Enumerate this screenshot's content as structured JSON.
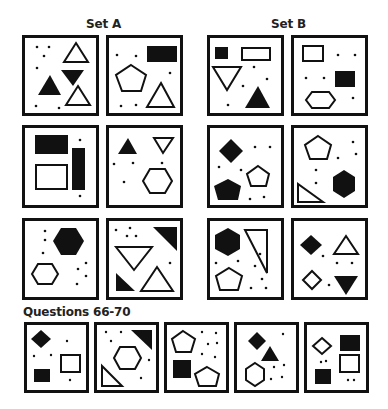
{
  "labels": {
    "set_a": "Set A",
    "set_b": "Set B",
    "questions": "Questions 66-70"
  },
  "colors": {
    "ink": "#111111",
    "background": "#ffffff"
  },
  "set_a": [
    {
      "id": "A1",
      "shapes": [
        "outline-triangle-up",
        "filled-triangle-down",
        "filled-triangle-up",
        "outline-triangle-up"
      ],
      "dots": 6
    },
    {
      "id": "A2",
      "shapes": [
        "filled-rectangle",
        "outline-pentagon",
        "outline-triangle-up"
      ],
      "dots": 5
    },
    {
      "id": "A3",
      "shapes": [
        "filled-rectangle",
        "filled-tall-rectangle",
        "outline-rectangle"
      ],
      "dots": 2
    },
    {
      "id": "A4",
      "shapes": [
        "filled-triangle-up",
        "outline-triangle-down",
        "outline-hexagon"
      ],
      "dots": 4
    },
    {
      "id": "A5",
      "shapes": [
        "filled-hexagon",
        "outline-hexagon"
      ],
      "dots": 7
    },
    {
      "id": "A6",
      "shapes": [
        "filled-right-triangle",
        "outline-triangle-down",
        "filled-right-triangle",
        "outline-triangle-up"
      ],
      "dots": 4
    }
  ],
  "set_b": [
    {
      "id": "B1",
      "shapes": [
        "filled-square",
        "outline-rectangle",
        "outline-triangle-down",
        "filled-triangle-up"
      ],
      "dots": 4
    },
    {
      "id": "B2",
      "shapes": [
        "outline-rectangle",
        "filled-square",
        "outline-hexagon"
      ],
      "dots": 5
    },
    {
      "id": "B3",
      "shapes": [
        "filled-diamond",
        "outline-pentagon",
        "filled-pentagon"
      ],
      "dots": 6
    },
    {
      "id": "B4",
      "shapes": [
        "outline-pentagon",
        "filled-hexagon",
        "outline-right-triangle"
      ],
      "dots": 5
    },
    {
      "id": "B5",
      "shapes": [
        "filled-hexagon",
        "outline-right-triangle",
        "outline-pentagon"
      ],
      "dots": 7
    },
    {
      "id": "B6",
      "shapes": [
        "filled-diamond",
        "outline-triangle-up",
        "outline-diamond",
        "filled-triangle-down"
      ],
      "dots": 4
    }
  ],
  "questions": [
    {
      "number": "66",
      "shapes": [
        "filled-diamond",
        "outline-square",
        "filled-rectangle"
      ],
      "dots": 4
    },
    {
      "number": "67",
      "shapes": [
        "filled-right-triangle",
        "outline-hexagon",
        "outline-right-triangle"
      ],
      "dots": 5
    },
    {
      "number": "68",
      "shapes": [
        "outline-pentagon",
        "filled-square",
        "outline-pentagon"
      ],
      "dots": 7
    },
    {
      "number": "69",
      "shapes": [
        "filled-diamond",
        "filled-triangle-up",
        "outline-hexagon"
      ],
      "dots": 5
    },
    {
      "number": "70",
      "shapes": [
        "outline-diamond",
        "filled-rectangle",
        "outline-square",
        "filled-square"
      ],
      "dots": 4
    }
  ]
}
